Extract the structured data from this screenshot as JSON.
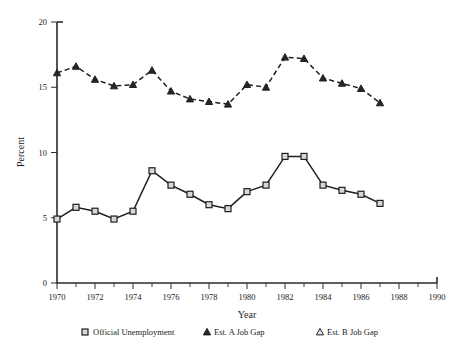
{
  "chart_data": {
    "type": "line",
    "title": "",
    "xlabel": "Year",
    "ylabel": "Percent",
    "xlim": [
      1970,
      1990
    ],
    "ylim": [
      0,
      20
    ],
    "grid": false,
    "legend_position": "bottom",
    "x_major_ticks": [
      1970,
      1972,
      1974,
      1976,
      1978,
      1980,
      1982,
      1984,
      1986,
      1988,
      1990
    ],
    "x_minor_ticks": [
      1971,
      1973,
      1975,
      1977,
      1979,
      1981,
      1983,
      1985,
      1987,
      1989
    ],
    "y_major_ticks": [
      0,
      5,
      10,
      15,
      20
    ],
    "x": [
      1970,
      1971,
      1972,
      1973,
      1974,
      1975,
      1976,
      1977,
      1978,
      1979,
      1980,
      1981,
      1982,
      1983,
      1984,
      1985,
      1986,
      1987
    ],
    "series": [
      {
        "name": "Official Unemployment Rate",
        "marker": "triangle",
        "linestyle": "dashed",
        "values": [
          16.1,
          16.6,
          15.6,
          15.1,
          15.2,
          16.3,
          14.7,
          14.1,
          13.9,
          13.7,
          15.2,
          15.0,
          17.3,
          17.2,
          15.7,
          15.3,
          14.9,
          13.8
        ]
      },
      {
        "name": "Employment-Population Deficit",
        "marker": "square",
        "linestyle": "solid",
        "values": [
          4.9,
          5.8,
          5.5,
          4.9,
          5.5,
          8.6,
          7.5,
          6.8,
          6.0,
          5.7,
          7.0,
          7.5,
          9.7,
          9.7,
          7.5,
          7.1,
          6.8,
          6.1
        ]
      }
    ]
  },
  "axis": {
    "ylabel": "Percent",
    "xlabel": "Year",
    "ytick_0": "0",
    "ytick_5": "5",
    "ytick_10": "10",
    "ytick_15": "15",
    "ytick_20": "20",
    "xtick_1970": "1970",
    "xtick_1972": "1972",
    "xtick_1974": "1974",
    "xtick_1976": "1976",
    "xtick_1978": "1978",
    "xtick_1980": "1980",
    "xtick_1982": "1982",
    "xtick_1984": "1984",
    "xtick_1986": "1986",
    "xtick_1988": "1988",
    "xtick_1990": "1990"
  },
  "legend": {
    "entry_1": "Official Unemployment",
    "entry_2": "Est. A Job Gap",
    "entry_3": "Est. B Job Gap"
  }
}
